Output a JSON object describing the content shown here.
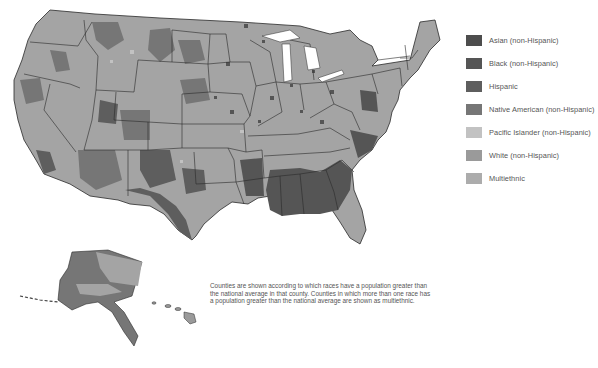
{
  "colors": {
    "asian": "#4d4d4d",
    "black": "#555555",
    "hispanic": "#5e5e5e",
    "native_american": "#767676",
    "pacific_islander": "#c2c2c2",
    "white": "#9a9a9a",
    "multiethnic": "#acacac",
    "state_border": "#2a2a2a",
    "background": "#ffffff"
  },
  "legend": {
    "items": [
      {
        "label": "Asian (non-Hispanic)",
        "color": "#4d4d4d"
      },
      {
        "label": "Black (non-Hispanic)",
        "color": "#555555"
      },
      {
        "label": "Hispanic",
        "color": "#5e5e5e"
      },
      {
        "label": "Native American (non-Hispanic)",
        "color": "#767676"
      },
      {
        "label": "Pacific Islander (non-Hispanic)",
        "color": "#c2c2c2"
      },
      {
        "label": "White (non-Hispanic)",
        "color": "#9a9a9a"
      },
      {
        "label": "Multiethnic",
        "color": "#acacac"
      }
    ]
  },
  "caption": "Counties are shown according to which races have a population greater than the national average in that county. Counties in which more than one race has a population greater than the national average are shown as multiethnic."
}
